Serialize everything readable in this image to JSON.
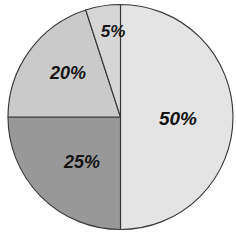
{
  "chart_data": {
    "type": "pie",
    "title": "",
    "subtitle": "",
    "xlabel": "",
    "ylabel": "",
    "grid": false,
    "legend": "none",
    "start_angle_deg": 0,
    "direction": "clockwise",
    "categories": [
      "50%",
      "25%",
      "20%",
      "5%"
    ],
    "values": [
      50,
      25,
      20,
      5
    ],
    "labels": [
      "50%",
      "25%",
      "20%",
      "5%"
    ],
    "slices": [
      {
        "label": "50%",
        "value": 50,
        "start_deg": 0,
        "end_deg": 180,
        "color": "#e4e4e4",
        "stroke": "#3a3a3a",
        "label_x": 178,
        "label_y": 120,
        "label_size": 19
      },
      {
        "label": "25%",
        "value": 25,
        "start_deg": 180,
        "end_deg": 270,
        "color": "#989898",
        "stroke": "#3a3a3a",
        "label_x": 82,
        "label_y": 163,
        "label_size": 18
      },
      {
        "label": "20%",
        "value": 20,
        "start_deg": 270,
        "end_deg": 342,
        "color": "#cacaca",
        "stroke": "#3a3a3a",
        "label_x": 68,
        "label_y": 74,
        "label_size": 18
      },
      {
        "label": "5%",
        "value": 5,
        "start_deg": 342,
        "end_deg": 360,
        "color": "#d6d6d6",
        "stroke": "#3a3a3a",
        "label_x": 113,
        "label_y": 33,
        "label_size": 17
      }
    ],
    "geometry": {
      "center_x": 120.5,
      "center_y": 117,
      "radius": 112.5
    },
    "background_color": "#ffffff"
  }
}
